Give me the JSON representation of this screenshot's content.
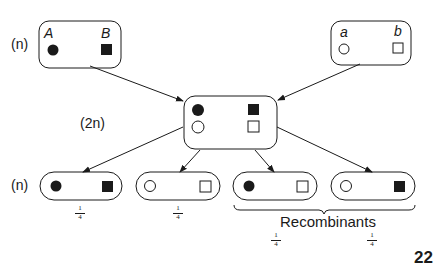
{
  "diagram": {
    "parent_left": {
      "ploidy": "(n)",
      "allele1": "A",
      "allele2": "B",
      "marker1": "filled-circle",
      "marker2": "filled-square"
    },
    "parent_right": {
      "allele1": "a",
      "allele2": "b",
      "marker1": "open-circle",
      "marker2": "open-square"
    },
    "zygote": {
      "ploidy": "(2n)",
      "row1": [
        "filled-circle",
        "filled-square"
      ],
      "row2": [
        "open-circle",
        "open-square"
      ]
    },
    "progeny": {
      "ploidy": "(n)",
      "items": [
        {
          "markers": [
            "filled-circle",
            "filled-square"
          ],
          "frequency_num": "1",
          "frequency_den": "4",
          "type": "parental"
        },
        {
          "markers": [
            "open-circle",
            "open-square"
          ],
          "frequency_num": "1",
          "frequency_den": "4",
          "type": "parental"
        },
        {
          "markers": [
            "filled-circle",
            "open-square"
          ],
          "frequency_num": "1",
          "frequency_den": "4",
          "type": "recombinant"
        },
        {
          "markers": [
            "open-circle",
            "filled-square"
          ],
          "frequency_num": "1",
          "frequency_den": "4",
          "type": "recombinant"
        }
      ],
      "recombinants_label": "Recombinants"
    },
    "page_number": "22",
    "colors": {
      "stroke": "#1a1a1a",
      "fill": "#1a1a1a",
      "background": "#ffffff"
    }
  }
}
